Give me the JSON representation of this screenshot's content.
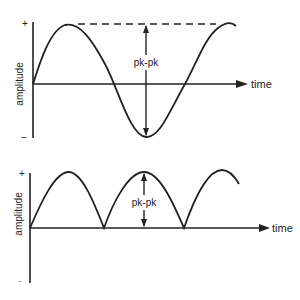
{
  "diagrams": [
    {
      "id": "sine-wave",
      "y_axis_label": "amplitude",
      "x_axis_label": "time",
      "plus_label": "+",
      "minus_label": "−",
      "measure_label": "pk-pk"
    },
    {
      "id": "rectified-wave",
      "y_axis_label": "amplitude",
      "x_axis_label": "time",
      "plus_label": "+",
      "minus_label": "-",
      "measure_label": "pk-pk"
    }
  ],
  "colors": {
    "line": "#222222",
    "background": "#ffffff"
  }
}
